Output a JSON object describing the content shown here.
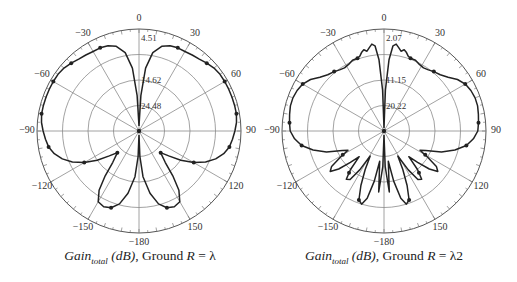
{
  "chart_data": [
    {
      "type": "polar-line",
      "title": "Gain_total (dB), Ground R = λ",
      "caption": {
        "main": "Gain",
        "sub": "total",
        "unit": " (dB)",
        "rest": ", Ground ",
        "var": "R",
        "eq": " = λ"
      },
      "angle_ticks": [
        0,
        30,
        60,
        90,
        120,
        150,
        -180,
        -150,
        -120,
        -90,
        -60,
        -30
      ],
      "radial_labels": [
        "4.51",
        "14.62",
        "24.48"
      ],
      "rings": 4,
      "grid": true,
      "center": [
        139,
        131
      ],
      "radius": 102,
      "series": [
        {
          "name": "Gain_total",
          "angles_deg": [
            0,
            3,
            6,
            10,
            15,
            20,
            25,
            30,
            35,
            40,
            45,
            50,
            55,
            60,
            65,
            70,
            75,
            80,
            85,
            90,
            95,
            100,
            105,
            110,
            115,
            120,
            125,
            130,
            135,
            140,
            143,
            146,
            150,
            155,
            160,
            165,
            170,
            175,
            178,
            180
          ],
          "r_norm": [
            0.05,
            0.35,
            0.62,
            0.78,
            0.86,
            0.89,
            0.9,
            0.9,
            0.91,
            0.92,
            0.94,
            0.96,
            0.97,
            0.97,
            0.97,
            0.97,
            0.97,
            0.97,
            0.96,
            0.94,
            0.92,
            0.9,
            0.86,
            0.8,
            0.72,
            0.62,
            0.5,
            0.38,
            0.3,
            0.4,
            0.55,
            0.7,
            0.8,
            0.82,
            0.8,
            0.74,
            0.62,
            0.45,
            0.25,
            0.04
          ],
          "marker_angles": [
            25,
            45,
            60,
            80,
            100,
            120,
            135,
            160
          ]
        }
      ]
    },
    {
      "type": "polar-line",
      "title": "Gain_total (dB), Ground R = λ2",
      "caption": {
        "main": "Gain",
        "sub": "total",
        "unit": " (dB)",
        "rest": ", Ground ",
        "var": "R",
        "eq": " = λ2"
      },
      "angle_ticks": [
        0,
        30,
        60,
        90,
        120,
        150,
        -180,
        -150,
        -120,
        -90,
        -60,
        -30
      ],
      "radial_labels": [
        "2.07",
        "11.15",
        "20.22"
      ],
      "rings": 4,
      "grid": true,
      "center": [
        384,
        131
      ],
      "radius": 102,
      "series": [
        {
          "name": "Gain_total",
          "angles_deg": [
            0,
            2,
            4,
            6,
            8,
            10,
            12,
            14,
            16,
            18,
            20,
            24,
            28,
            32,
            36,
            40,
            45,
            50,
            55,
            60,
            65,
            70,
            75,
            80,
            85,
            90,
            95,
            100,
            105,
            110,
            115,
            118,
            121,
            124,
            127,
            130,
            133,
            136,
            139,
            142,
            145,
            148,
            151,
            154,
            157,
            160,
            163,
            166,
            169,
            172,
            175,
            178,
            180
          ],
          "r_norm": [
            0.03,
            0.4,
            0.7,
            0.84,
            0.86,
            0.83,
            0.8,
            0.82,
            0.8,
            0.77,
            0.76,
            0.76,
            0.74,
            0.73,
            0.74,
            0.76,
            0.78,
            0.82,
            0.88,
            0.92,
            0.94,
            0.95,
            0.95,
            0.94,
            0.93,
            0.92,
            0.88,
            0.82,
            0.72,
            0.6,
            0.45,
            0.4,
            0.5,
            0.62,
            0.66,
            0.58,
            0.45,
            0.35,
            0.5,
            0.6,
            0.58,
            0.45,
            0.28,
            0.42,
            0.58,
            0.72,
            0.75,
            0.68,
            0.5,
            0.3,
            0.6,
            0.35,
            0.04
          ],
          "marker_angles": [
            20,
            40,
            60,
            85,
            100,
            120,
            140,
            160
          ]
        }
      ]
    }
  ]
}
